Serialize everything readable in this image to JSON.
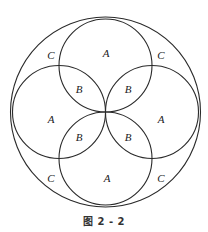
{
  "diagram": {
    "stroke_color": "#2a2a2a",
    "outer_circle": {
      "cx": 105.5,
      "cy": 112,
      "r": 95
    },
    "inner_circles": [
      {
        "name": "top",
        "cx": 105.5,
        "cy": 65.5,
        "r": 46.5
      },
      {
        "name": "left",
        "cx": 59,
        "cy": 112,
        "r": 46.5
      },
      {
        "name": "right",
        "cx": 152,
        "cy": 112,
        "r": 46.5
      },
      {
        "name": "bottom",
        "cx": 105.5,
        "cy": 158.5,
        "r": 46.5
      }
    ],
    "labels": [
      {
        "text": "C",
        "x": 51,
        "y": 59,
        "region": "outer-top-left"
      },
      {
        "text": "A",
        "x": 106,
        "y": 57,
        "region": "top-circle"
      },
      {
        "text": "C",
        "x": 161,
        "y": 59,
        "region": "outer-top-right"
      },
      {
        "text": "B",
        "x": 79,
        "y": 93,
        "region": "top-left-lens"
      },
      {
        "text": "B",
        "x": 128,
        "y": 93,
        "region": "top-right-lens"
      },
      {
        "text": "A",
        "x": 51,
        "y": 123,
        "region": "left-circle"
      },
      {
        "text": "A",
        "x": 161,
        "y": 123,
        "region": "right-circle"
      },
      {
        "text": "B",
        "x": 79,
        "y": 141,
        "region": "bottom-left-lens"
      },
      {
        "text": "B",
        "x": 128,
        "y": 141,
        "region": "bottom-right-lens"
      },
      {
        "text": "C",
        "x": 51,
        "y": 182,
        "region": "outer-bottom-left"
      },
      {
        "text": "A",
        "x": 107,
        "y": 182,
        "region": "bottom-circle"
      },
      {
        "text": "C",
        "x": 161,
        "y": 182,
        "region": "outer-bottom-right"
      }
    ]
  },
  "caption": "图 2 - 2"
}
